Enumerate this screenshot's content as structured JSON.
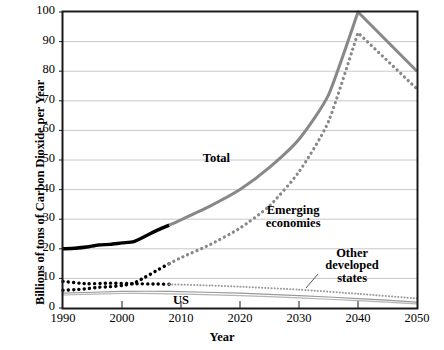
{
  "chart_data": {
    "type": "line",
    "title": "",
    "xlabel": "Year",
    "ylabel": "Billions of tons of Carbon Dioxide per Year",
    "xlim": [
      1990,
      2050
    ],
    "ylim": [
      0,
      100
    ],
    "xticks": [
      "1990",
      "2000",
      "2010",
      "2020",
      "2030",
      "2040",
      "2050"
    ],
    "yticks": [
      "0",
      "10",
      "20",
      "30",
      "40",
      "50",
      "60",
      "70",
      "80",
      "90",
      "100"
    ],
    "grid": "horizontal",
    "legend_position": "inline-annotations",
    "series": [
      {
        "name": "Total (historical)",
        "style": "solid-thick-black",
        "color": "#000000",
        "x": [
          1990,
          1992,
          1994,
          1996,
          1998,
          2000,
          2002,
          2004,
          2006,
          2008
        ],
        "values": [
          20.0,
          20.2,
          20.6,
          21.3,
          21.5,
          22.0,
          22.4,
          24.3,
          26.3,
          28.0
        ]
      },
      {
        "name": "Total (projection)",
        "style": "solid-thick-gray",
        "color": "#888888",
        "x": [
          2008,
          2010,
          2015,
          2020,
          2025,
          2030,
          2035,
          2040,
          2050
        ],
        "values": [
          28.0,
          29.8,
          34.5,
          40.0,
          47.5,
          57.0,
          72.0,
          100.0,
          80.0
        ]
      },
      {
        "name": "Emerging economies (historical)",
        "style": "dotted-thick-black",
        "color": "#000000",
        "x": [
          1990,
          1992,
          1994,
          1996,
          1998,
          2000,
          2002,
          2004,
          2006,
          2008
        ],
        "values": [
          6.0,
          6.2,
          6.5,
          7.0,
          7.2,
          7.6,
          8.4,
          10.5,
          12.8,
          15.0
        ],
        "note": "lower black dotted trace near 6-9 in 1990s is the overlapping other-developed-states historical series"
      },
      {
        "name": "Emerging economies (projection)",
        "style": "dotted-thick-gray",
        "color": "#888888",
        "x": [
          2008,
          2010,
          2015,
          2020,
          2025,
          2030,
          2035,
          2040,
          2050
        ],
        "values": [
          15.0,
          17.0,
          21.5,
          27.0,
          34.5,
          46.0,
          63.0,
          93.0,
          74.0
        ]
      },
      {
        "name": "Other developed states (historical)",
        "style": "dotted-thick-black",
        "color": "#000000",
        "x": [
          1990,
          1994,
          1998,
          2002,
          2006,
          2008
        ],
        "values": [
          9.0,
          8.2,
          8.4,
          8.2,
          8.1,
          8.0
        ]
      },
      {
        "name": "Other developed states (projection)",
        "style": "dotted-thin-gray",
        "color": "#9a9a9a",
        "x": [
          2008,
          2015,
          2020,
          2030,
          2040,
          2050
        ],
        "values": [
          8.0,
          7.6,
          7.2,
          6.2,
          4.8,
          3.2
        ]
      },
      {
        "name": "US",
        "style": "solid-thin-gray",
        "color": "#999999",
        "x": [
          1990,
          2000,
          2008,
          2020,
          2030,
          2040,
          2050
        ],
        "values": [
          5.0,
          5.6,
          5.6,
          5.0,
          4.2,
          3.2,
          2.0
        ]
      },
      {
        "name": "US (lower bound)",
        "style": "solid-thin-gray",
        "color": "#b4b4b4",
        "x": [
          1990,
          2000,
          2008,
          2020,
          2030,
          2040,
          2050
        ],
        "values": [
          4.4,
          4.9,
          4.8,
          4.2,
          3.4,
          2.5,
          1.4
        ]
      }
    ],
    "annotations": [
      {
        "text": "Total",
        "x": 2016,
        "y": 50
      },
      {
        "text": "Emerging",
        "x": 2029,
        "y": 31
      },
      {
        "text": "economies",
        "x": 2029,
        "y": 27
      },
      {
        "text": "Other",
        "x": 2039,
        "y": 19
      },
      {
        "text": "developed",
        "x": 2039,
        "y": 15.5
      },
      {
        "text": "states",
        "x": 2039,
        "y": 12
      },
      {
        "text": "US",
        "x": 2010,
        "y": 2
      }
    ]
  },
  "annotations": {
    "total": "Total",
    "emerging_line1": "Emerging",
    "emerging_line2": "economies",
    "other_line1": "Other",
    "other_line2": "developed",
    "other_line3": "states",
    "us": "US"
  },
  "axes": {
    "xlabel": "Year",
    "ylabel": "Billions of tons of Carbon Dioxide per Year"
  },
  "colors": {
    "historical": "#000000",
    "projection": "#888888",
    "us": "#999999",
    "grid": "#c8c8c8",
    "frame": "#1a1a1a"
  }
}
